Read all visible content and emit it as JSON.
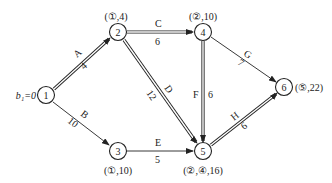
{
  "diagram": {
    "type": "network-shortest-path",
    "start_label": "b₁=0",
    "nodes": [
      {
        "id": "1",
        "label": "1",
        "x": 46,
        "y": 95,
        "annotation": ""
      },
      {
        "id": "2",
        "label": "2",
        "x": 118,
        "y": 32,
        "annotation": "(①,4)",
        "ax": 116,
        "ay": 20
      },
      {
        "id": "3",
        "label": "3",
        "x": 118,
        "y": 151,
        "annotation": "(①,10)",
        "ax": 118,
        "ay": 173
      },
      {
        "id": "4",
        "label": "4",
        "x": 203,
        "y": 32,
        "annotation": "(②,10)",
        "ax": 203,
        "ay": 20
      },
      {
        "id": "5",
        "label": "5",
        "x": 203,
        "y": 151,
        "annotation": "(②,④,16)",
        "ax": 203,
        "ay": 173
      },
      {
        "id": "6",
        "label": "6",
        "x": 284,
        "y": 87,
        "annotation": "(⑤,22)",
        "ax": 312,
        "ay": 91
      }
    ],
    "edges": [
      {
        "name": "A",
        "weight": "4",
        "from": "1",
        "to": "2",
        "critical": true
      },
      {
        "name": "B",
        "weight": "10",
        "from": "1",
        "to": "3",
        "critical": false
      },
      {
        "name": "C",
        "weight": "6",
        "from": "2",
        "to": "4",
        "critical": true
      },
      {
        "name": "D",
        "weight": "12",
        "from": "2",
        "to": "5",
        "critical": true
      },
      {
        "name": "E",
        "weight": "5",
        "from": "3",
        "to": "5",
        "critical": false
      },
      {
        "name": "F",
        "weight": "6",
        "from": "4",
        "to": "5",
        "critical": true
      },
      {
        "name": "G",
        "weight": "7",
        "from": "4",
        "to": "6",
        "critical": false
      },
      {
        "name": "H",
        "weight": "6",
        "from": "5",
        "to": "6",
        "critical": true
      }
    ]
  },
  "labels": {
    "start": "b₁=0",
    "n1": "1",
    "n2": "2",
    "n3": "3",
    "n4": "4",
    "n5": "5",
    "n6": "6",
    "ann2": "(①,4)",
    "ann3": "(①,10)",
    "ann4": "(②,10)",
    "ann5": "(②,④,16)",
    "ann6": "(⑤,22)",
    "A": "A",
    "A_w": "4",
    "B": "B",
    "B_w": "10",
    "C": "C",
    "C_w": "6",
    "D": "D",
    "D_w": "12",
    "E": "E",
    "E_w": "5",
    "F": "F",
    "F_w": "6",
    "G": "G",
    "G_w": "7",
    "H": "H",
    "H_w": "6"
  },
  "colors": {
    "line": "#222222",
    "background": "#ffffff"
  }
}
